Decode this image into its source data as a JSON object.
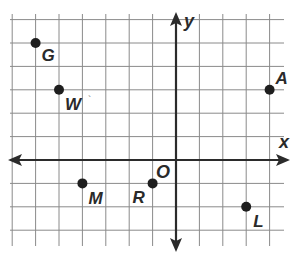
{
  "diagram": {
    "type": "coordinate-plane",
    "axes": {
      "x_label": "x",
      "y_label": "y",
      "origin_label": "O"
    },
    "grid": {
      "x_min": -7,
      "x_max": 4,
      "y_min": -3,
      "y_max": 6,
      "spacing_px": 23.4
    },
    "points": [
      {
        "name": "G",
        "x": -6,
        "y": 5
      },
      {
        "name": "W",
        "x": -5,
        "y": 3
      },
      {
        "name": "A",
        "x": 4,
        "y": 3
      },
      {
        "name": "M",
        "x": -4,
        "y": -1
      },
      {
        "name": "R",
        "x": -1,
        "y": -1
      },
      {
        "name": "L",
        "x": 3,
        "y": -2
      }
    ],
    "colors": {
      "grid": "#8a8a8a",
      "axis": "#2b2b2b",
      "point": "#1e1e1e",
      "label": "#2a2a2a"
    }
  }
}
